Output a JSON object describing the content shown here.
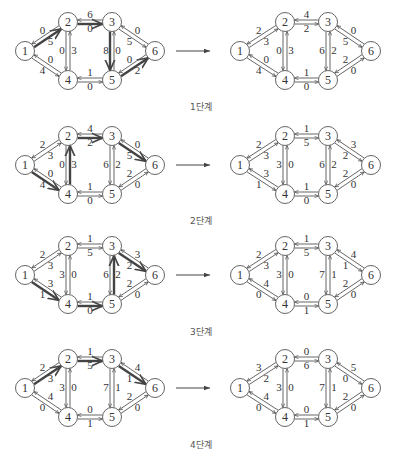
{
  "colors": {
    "line": "#555555",
    "thick": "#444444",
    "node_fill": "#ffffff",
    "node_stroke": "#555555",
    "text": "#333333"
  },
  "layout": {
    "left_nodes": {
      "1": [
        25,
        51
      ],
      "2": [
        68,
        22
      ],
      "3": [
        112,
        22
      ],
      "4": [
        68,
        80
      ],
      "5": [
        112,
        80
      ],
      "6": [
        155,
        51
      ]
    },
    "right_nodes": {
      "1": [
        240,
        51
      ],
      "2": [
        285,
        22
      ],
      "3": [
        328,
        22
      ],
      "4": [
        285,
        80
      ],
      "5": [
        328,
        80
      ],
      "6": [
        371,
        51
      ]
    },
    "arrow": {
      "x1": 176,
      "x2": 210,
      "y": 51
    },
    "stage_offsets": [
      0,
      114,
      224,
      337
    ],
    "label_y_offsets": [
      100,
      100,
      101,
      101
    ],
    "label_x": 190
  },
  "stages": [
    {
      "label": "1단계",
      "left": {
        "highlight_path": [
          1,
          2,
          3,
          5,
          6
        ],
        "edges": {
          "1-2": {
            "fwd": "5",
            "back": "0"
          },
          "1-4": {
            "fwd": "4",
            "back": "0"
          },
          "2-3": {
            "fwd": "6",
            "back": "0"
          },
          "2-4": {
            "fwd": "0",
            "back": "3"
          },
          "4-5": {
            "fwd": "1",
            "back": "0"
          },
          "3-5": {
            "fwd": "8",
            "back": "0"
          },
          "3-6": {
            "fwd": "5",
            "back": "0"
          },
          "5-6": {
            "fwd": "2",
            "back": "0"
          }
        }
      },
      "right": {
        "edges": {
          "1-2": {
            "fwd": "3",
            "back": "2"
          },
          "1-4": {
            "fwd": "4",
            "back": "0"
          },
          "2-3": {
            "fwd": "4",
            "back": "2"
          },
          "2-4": {
            "fwd": "0",
            "back": "3"
          },
          "4-5": {
            "fwd": "1",
            "back": "0"
          },
          "3-5": {
            "fwd": "6",
            "back": "2"
          },
          "3-6": {
            "fwd": "5",
            "back": "0"
          },
          "5-6": {
            "fwd": "0",
            "back": "2"
          }
        }
      }
    },
    {
      "label": "2단계",
      "left": {
        "highlight_path": [
          1,
          4,
          2,
          3,
          6
        ],
        "edges": {
          "1-2": {
            "fwd": "3",
            "back": "2"
          },
          "1-4": {
            "fwd": "4",
            "back": "0"
          },
          "2-3": {
            "fwd": "4",
            "back": "2"
          },
          "2-4": {
            "fwd": "0",
            "back": "3"
          },
          "4-5": {
            "fwd": "1",
            "back": "0"
          },
          "3-5": {
            "fwd": "6",
            "back": "2"
          },
          "3-6": {
            "fwd": "5",
            "back": "0"
          },
          "5-6": {
            "fwd": "0",
            "back": "2"
          }
        }
      },
      "right": {
        "edges": {
          "1-2": {
            "fwd": "3",
            "back": "2"
          },
          "1-4": {
            "fwd": "1",
            "back": "3"
          },
          "2-3": {
            "fwd": "1",
            "back": "5"
          },
          "2-4": {
            "fwd": "3",
            "back": "0"
          },
          "4-5": {
            "fwd": "1",
            "back": "0"
          },
          "3-5": {
            "fwd": "6",
            "back": "2"
          },
          "3-6": {
            "fwd": "2",
            "back": "3"
          },
          "5-6": {
            "fwd": "0",
            "back": "2"
          }
        }
      }
    },
    {
      "label": "3단계",
      "left": {
        "highlight_path": [
          1,
          4,
          5,
          3,
          6
        ],
        "edges": {
          "1-2": {
            "fwd": "3",
            "back": "2"
          },
          "1-4": {
            "fwd": "1",
            "back": "3"
          },
          "2-3": {
            "fwd": "1",
            "back": "5"
          },
          "2-4": {
            "fwd": "3",
            "back": "0"
          },
          "4-5": {
            "fwd": "1",
            "back": "0"
          },
          "3-5": {
            "fwd": "6",
            "back": "2"
          },
          "3-6": {
            "fwd": "2",
            "back": "3"
          },
          "5-6": {
            "fwd": "0",
            "back": "2"
          }
        }
      },
      "right": {
        "edges": {
          "1-2": {
            "fwd": "3",
            "back": "2"
          },
          "1-4": {
            "fwd": "0",
            "back": "4"
          },
          "2-3": {
            "fwd": "1",
            "back": "5"
          },
          "2-4": {
            "fwd": "3",
            "back": "0"
          },
          "4-5": {
            "fwd": "0",
            "back": "1"
          },
          "3-5": {
            "fwd": "7",
            "back": "1"
          },
          "3-6": {
            "fwd": "1",
            "back": "4"
          },
          "5-6": {
            "fwd": "0",
            "back": "2"
          }
        }
      }
    },
    {
      "label": "4단계",
      "left": {
        "highlight_path": [
          1,
          2,
          3,
          6
        ],
        "edges": {
          "1-2": {
            "fwd": "3",
            "back": "2"
          },
          "1-4": {
            "fwd": "0",
            "back": "4"
          },
          "2-3": {
            "fwd": "1",
            "back": "5"
          },
          "2-4": {
            "fwd": "3",
            "back": "0"
          },
          "4-5": {
            "fwd": "0",
            "back": "1"
          },
          "3-5": {
            "fwd": "7",
            "back": "1"
          },
          "3-6": {
            "fwd": "1",
            "back": "4"
          },
          "5-6": {
            "fwd": "0",
            "back": "2"
          }
        }
      },
      "right": {
        "edges": {
          "1-2": {
            "fwd": "2",
            "back": "3"
          },
          "1-4": {
            "fwd": "0",
            "back": "4"
          },
          "2-3": {
            "fwd": "0",
            "back": "6"
          },
          "2-4": {
            "fwd": "3",
            "back": "0"
          },
          "4-5": {
            "fwd": "0",
            "back": "1"
          },
          "3-5": {
            "fwd": "7",
            "back": "1"
          },
          "3-6": {
            "fwd": "0",
            "back": "5"
          },
          "5-6": {
            "fwd": "0",
            "back": "2"
          }
        }
      }
    }
  ]
}
